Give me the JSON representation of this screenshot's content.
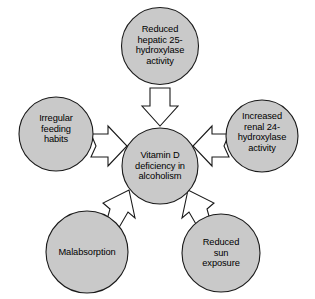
{
  "diagram": {
    "type": "radial-cause-diagram",
    "colors": {
      "node_fill": "#c9c9c9",
      "node_stroke": "#1a1a1a",
      "arrow_fill": "#ffffff",
      "arrow_stroke": "#1a1a1a",
      "text": "#000000",
      "background": "#ffffff"
    },
    "center": {
      "id": "vitamin-d-deficiency",
      "label": "Vitamin D\ndeficiency in\nalcoholism"
    },
    "causes": [
      {
        "id": "reduced-hepatic-hydroxylase",
        "position": "top",
        "label": "Reduced\nhepatic 25-\nhydroxylase\nactivity",
        "arrow_direction": "down"
      },
      {
        "id": "irregular-feeding-habits",
        "position": "left",
        "label": "Irregular\nfeeding\nhabits",
        "arrow_direction": "right"
      },
      {
        "id": "increased-renal-hydroxylase",
        "position": "right",
        "label": "Increased\nrenal 24-\nhydroxylase\nactivity",
        "arrow_direction": "left"
      },
      {
        "id": "malabsorption",
        "position": "bottom-left",
        "label": "Malabsorption",
        "arrow_direction": "up-right"
      },
      {
        "id": "reduced-sun-exposure",
        "position": "bottom-right",
        "label": "Reduced\nsun\nexposure",
        "arrow_direction": "up-left"
      }
    ]
  }
}
